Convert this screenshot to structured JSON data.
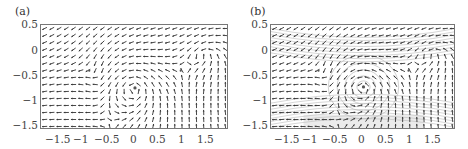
{
  "chart_data": [
    {
      "type": "quiver",
      "panel_label": "(a)",
      "title": "",
      "xlabel": "",
      "ylabel": "",
      "xlim": [
        -1.85,
        1.85
      ],
      "ylim": [
        -1.55,
        0.52
      ],
      "xticks": [
        "-1.5",
        "-1",
        "-0.5",
        "0",
        "0.5",
        "1",
        "1.5"
      ],
      "yticks": [
        "0.5",
        "0",
        "-0.5",
        "-1",
        "-1.5"
      ],
      "grid": false,
      "critical_points": [
        {
          "x": -0.9,
          "y": -0.38,
          "kind": "saddle"
        },
        {
          "x": 0.0,
          "y": -0.72,
          "kind": "center"
        },
        {
          "x": 0.9,
          "y": -0.38,
          "kind": "saddle"
        }
      ],
      "streamlines": false
    },
    {
      "type": "quiver",
      "panel_label": "(b)",
      "title": "",
      "xlabel": "",
      "ylabel": "",
      "xlim": [
        -1.85,
        1.85
      ],
      "ylim": [
        -1.55,
        0.52
      ],
      "xticks": [
        "-1.5",
        "-1",
        "-0.5",
        "0",
        "0.5",
        "1",
        "1.5"
      ],
      "yticks": [
        "0.5",
        "0",
        "-0.5",
        "-1",
        "-1.5"
      ],
      "grid": false,
      "critical_points": [
        {
          "x": -0.9,
          "y": -0.38,
          "kind": "saddle"
        },
        {
          "x": 0.0,
          "y": -0.7,
          "kind": "center"
        },
        {
          "x": 0.9,
          "y": -0.38,
          "kind": "saddle"
        }
      ],
      "streamlines": true
    }
  ],
  "panels": [
    {
      "label": "(a)"
    },
    {
      "label": "(b)"
    }
  ],
  "colors": {
    "arrow": "#333333",
    "frame": "#777777",
    "streamline": "#bbbbbb",
    "shade": "#dddddd"
  }
}
